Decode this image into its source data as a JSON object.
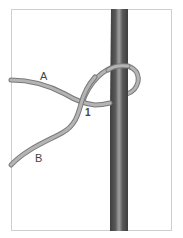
{
  "diagram": {
    "type": "knot-step-illustration",
    "labels": {
      "end_a": "A",
      "end_b": "B",
      "step": "1"
    },
    "colors": {
      "rope": "#a8a8a8",
      "rope_edge": "#7a7a7a",
      "pole_dark": "#4a4a4a",
      "pole_light": "#9a9a9a",
      "frame": "#cfcfcf"
    }
  }
}
